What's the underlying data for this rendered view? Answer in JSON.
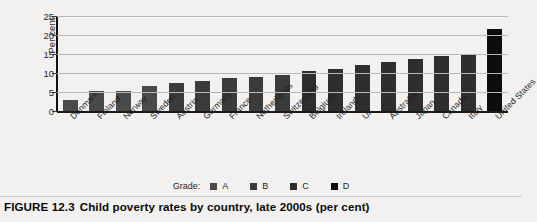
{
  "figure": {
    "number": "FIGURE 12.3",
    "title": "Child poverty rates by country, late 2000s (per cent)"
  },
  "axes": {
    "ylabel": "Per cent",
    "yticks": [
      "0",
      "5",
      "10",
      "15",
      "20",
      "25"
    ]
  },
  "legend": {
    "title": "Grade:",
    "items": [
      {
        "label": "A",
        "color": "#4a4a4a"
      },
      {
        "label": "B",
        "color": "#3b3b3b"
      },
      {
        "label": "C",
        "color": "#2e2e2e"
      },
      {
        "label": "D",
        "color": "#0d0d0d"
      }
    ]
  },
  "chart_data": {
    "type": "bar",
    "title": "Child poverty rates by country, late 2000s (per cent)",
    "xlabel": "",
    "ylabel": "Per cent",
    "ylim": [
      0,
      25
    ],
    "ytick_step": 5,
    "grid": true,
    "legend_position": "bottom",
    "categories": [
      "Denmark",
      "Finland",
      "Norway",
      "Sweden",
      "Austria",
      "Germany",
      "France",
      "Netherlands",
      "Switzerland",
      "Belgium",
      "Ireland",
      "UK",
      "Australia",
      "Japan",
      "Canada",
      "Italy",
      "United States"
    ],
    "values": [
      3.0,
      5.3,
      5.3,
      6.5,
      7.5,
      8.0,
      8.8,
      9.0,
      9.5,
      10.5,
      11.0,
      12.0,
      13.0,
      13.7,
      14.5,
      15.0,
      21.5
    ],
    "grades": [
      "A",
      "A",
      "A",
      "A",
      "B",
      "B",
      "B",
      "B",
      "B",
      "C",
      "C",
      "C",
      "C",
      "C",
      "C",
      "C",
      "D"
    ],
    "bar_color": "#2b2b2b"
  }
}
